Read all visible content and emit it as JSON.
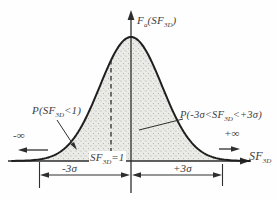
{
  "chart_data": {
    "type": "area",
    "curve": "normal (Gaussian) probability density function",
    "x_axis_label": "SF3D",
    "y_axis_label": "Fa(SF3D)",
    "x_range_labels": [
      "-∞",
      "+∞"
    ],
    "shaded_region": "entire area under the bell curve, stippled",
    "mean_offset_marker": "SF3D=1 (dashed line left of the mean)",
    "dimension_spans": [
      "-3σ",
      "+3σ"
    ],
    "annotations": [
      "P(SF3D<1)",
      "P(-3σ<SF3D<+3σ)",
      "SF3D=1"
    ]
  },
  "labels": {
    "y_axis": {
      "f": "F",
      "f_sub": "a",
      "mid": "(SF",
      "sf_sub": "3D",
      "end": ")"
    },
    "prob_left": {
      "pre": "P(SF",
      "sub": "3D",
      "post": "<1)"
    },
    "prob_right": {
      "pre": "P(-3σ<SF",
      "sub": "3D",
      "post": "<+3σ)"
    },
    "neg_infinity": "-∞",
    "pos_infinity": "+∞",
    "x_axis": {
      "pre": "SF",
      "sub": "3D"
    },
    "mean_marker": {
      "pre": "SF",
      "sub": "3D",
      "post": "=1"
    },
    "dim_left": "-3σ",
    "dim_right": "+3σ"
  },
  "colors": {
    "background": "#fefefe",
    "curve_stroke": "#1f1f1f",
    "line_stroke": "#2e2e2e",
    "fill_base": "#ebebe8",
    "fill_dots": "#a9a9a4",
    "text": "#3d3d3d"
  }
}
